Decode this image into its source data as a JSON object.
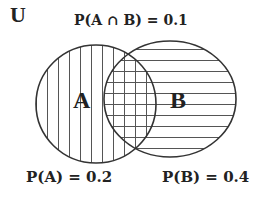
{
  "diagram": {
    "type": "venn",
    "universe_label": "U",
    "sets": [
      {
        "id": "A",
        "label": "A",
        "probability_label": "P(A) = 0.2",
        "hatch": "vertical"
      },
      {
        "id": "B",
        "label": "B",
        "probability_label": "P(B) = 0.4",
        "hatch": "horizontal"
      }
    ],
    "intersection": {
      "label": "P(A ∩ B) = 0.1",
      "hatch": "crosshatch"
    },
    "colors": {
      "stroke": "#333333",
      "hatch": "#555555",
      "background": "#ffffff"
    }
  }
}
